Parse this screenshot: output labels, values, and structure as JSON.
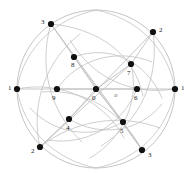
{
  "figure": {
    "type": "graph-diagram",
    "title": "",
    "background_color": "#ffffff",
    "width": 192,
    "height": 173,
    "center": {
      "x": 96,
      "y": 89
    },
    "outer_radius": 79,
    "inner_radius": 40,
    "node_color": "#111111",
    "node_radius": 3.1,
    "edge_color": "#b9b9b9",
    "arc_color": "#c2c2c2",
    "circle_color": "#b5b5b5",
    "label_color": "#1c1c1c",
    "faint_label_color": "#8d8d8d"
  },
  "nodes": [
    {
      "id": "n0",
      "label": "0",
      "x": 96,
      "y": 89,
      "lx": 92,
      "ly": 95,
      "ring": "center"
    },
    {
      "id": "n1r",
      "label": "1",
      "x": 175,
      "y": 89,
      "lx": 181,
      "ly": 85,
      "ring": "outer"
    },
    {
      "id": "n2u",
      "label": "2",
      "x": 153,
      "y": 32,
      "lx": 159,
      "ly": 27,
      "ring": "outer"
    },
    {
      "id": "n3u",
      "label": "3",
      "x": 51,
      "y": 24,
      "lx": 41,
      "ly": 19,
      "ring": "outer"
    },
    {
      "id": "n1l",
      "label": "1",
      "x": 17,
      "y": 89,
      "lx": 8,
      "ly": 85,
      "ring": "outer"
    },
    {
      "id": "n2d",
      "label": "2",
      "x": 40,
      "y": 147,
      "lx": 31,
      "ly": 148,
      "ring": "outer"
    },
    {
      "id": "n3d",
      "label": "3",
      "x": 142,
      "y": 150,
      "lx": 148,
      "ly": 152,
      "ring": "outer"
    },
    {
      "id": "n6",
      "label": "6",
      "x": 137,
      "y": 89,
      "lx": 134,
      "ly": 95,
      "ring": "inner"
    },
    {
      "id": "n7",
      "label": "7",
      "x": 131,
      "y": 64,
      "lx": 127,
      "ly": 70,
      "ring": "inner"
    },
    {
      "id": "n8",
      "label": "8",
      "x": 74,
      "y": 57,
      "lx": 71,
      "ly": 62,
      "ring": "inner"
    },
    {
      "id": "n9",
      "label": "9",
      "x": 57,
      "y": 89,
      "lx": 52,
      "ly": 95,
      "ring": "inner"
    },
    {
      "id": "n4",
      "label": "4",
      "x": 69,
      "y": 119,
      "lx": 66,
      "ly": 125,
      "ring": "inner"
    },
    {
      "id": "n5",
      "label": "5",
      "x": 123,
      "y": 122,
      "lx": 120,
      "ly": 128,
      "ring": "inner"
    }
  ],
  "markers": [
    {
      "id": "m-phi",
      "label": "⌀",
      "lx": 114,
      "ly": 92,
      "faint": true
    }
  ],
  "edges": [
    {
      "from": "n1l",
      "to": "n1r",
      "kind": "line"
    },
    {
      "from": "n3u",
      "to": "n5",
      "kind": "line"
    },
    {
      "from": "n2u",
      "to": "n4",
      "kind": "line"
    },
    {
      "from": "n2d",
      "to": "n7",
      "kind": "line"
    },
    {
      "from": "n3d",
      "to": "n8",
      "kind": "line"
    },
    {
      "from": "n3u",
      "to": "n8",
      "kind": "line"
    },
    {
      "from": "n2u",
      "to": "n7",
      "kind": "line"
    },
    {
      "from": "n2d",
      "to": "n4",
      "kind": "line"
    },
    {
      "from": "n3d",
      "to": "n5",
      "kind": "line"
    },
    {
      "from": "n7",
      "to": "n0",
      "kind": "line"
    },
    {
      "from": "n8",
      "to": "n0",
      "kind": "line"
    },
    {
      "from": "n4",
      "to": "n0",
      "kind": "line"
    },
    {
      "from": "n5",
      "to": "n0",
      "kind": "line"
    },
    {
      "from": "n9",
      "to": "n0",
      "kind": "line"
    },
    {
      "from": "n0",
      "to": "n6",
      "kind": "line"
    }
  ],
  "arcs": [
    {
      "id": "a1",
      "d": "M 17 89 C 24 46 58 18 96 10"
    },
    {
      "id": "a2",
      "d": "M 96 10 C 137 18 168 48 175 89"
    },
    {
      "id": "a3",
      "d": "M 175 89 C 168 131 137 160 96 168"
    },
    {
      "id": "a4",
      "d": "M 96 168 C 56 160 24 131 17 89"
    },
    {
      "id": "a5",
      "d": "M 51 24 C 96 28 134 52 143 96"
    },
    {
      "id": "a6",
      "d": "M 153 32 C 160 78 140 122 101 146"
    },
    {
      "id": "a7",
      "d": "M 17 89 C 60 80 104 100 124 138"
    },
    {
      "id": "a8",
      "d": "M 40 147 C 74 120 120 113 160 128"
    },
    {
      "id": "a9",
      "d": "M 142 150 C 122 112 86 88 42 92"
    },
    {
      "id": "a10",
      "d": "M 175 89 C 132 96 92 78 70 40"
    },
    {
      "id": "a11",
      "d": "M 51 24 C 38 66 50 112 82 142"
    },
    {
      "id": "a12",
      "d": "M 40 147 C 30 104 46 60 80 34"
    },
    {
      "id": "a13",
      "d": "M 74 57 C 108 44 146 60 162 98"
    },
    {
      "id": "a14",
      "d": "M 131 64 C 140 100 124 138 90 158"
    },
    {
      "id": "a15",
      "d": "M 57 89 C 78 58 118 48 152 62"
    },
    {
      "id": "a16",
      "d": "M 123 122 C 92 140 54 134 30 108"
    },
    {
      "id": "a17",
      "d": "M 69 119 C 100 138 140 132 162 104"
    },
    {
      "id": "a18",
      "d": "M 137 89 C 122 126 86 146 48 140"
    }
  ]
}
